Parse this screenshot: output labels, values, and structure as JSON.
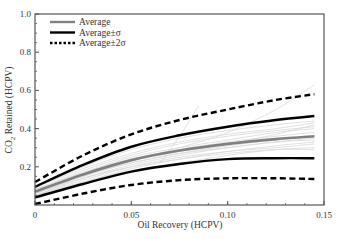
{
  "chart_data": {
    "type": "line",
    "title": "",
    "xlabel": "Oil Recovery (HCPV)",
    "ylabel": "CO2 Retained (HCPV)",
    "ylabel_parts": {
      "prefix": "CO",
      "sub": "2",
      "suffix": " Retained  (HCPV)"
    },
    "xlabel_display": "Oil Recovery  (HCPV)",
    "xlim": [
      0,
      0.15
    ],
    "ylim": [
      0,
      1.0
    ],
    "xticks": [
      0,
      0.05,
      0.1,
      0.15
    ],
    "xtick_labels": [
      "0",
      "0.05",
      "0.10",
      "0.15"
    ],
    "yticks": [
      0.2,
      0.4,
      0.6,
      0.8,
      1.0
    ],
    "ytick_labels": [
      "0.2",
      "0.4",
      "0.6",
      "0.8",
      "1.0"
    ],
    "grid": false,
    "legend_position": "upper left",
    "x": [
      0,
      0.025,
      0.05,
      0.075,
      0.1,
      0.125,
      0.145
    ],
    "series": [
      {
        "name": "Average",
        "style": "solid",
        "color": "#808080",
        "width": 2.6,
        "values": [
          0.07,
          0.16,
          0.235,
          0.285,
          0.32,
          0.345,
          0.36
        ]
      },
      {
        "name": "Average+σ",
        "legend": "Average±σ",
        "style": "solid",
        "color": "#000000",
        "width": 2.4,
        "values": [
          0.095,
          0.21,
          0.305,
          0.365,
          0.41,
          0.445,
          0.466
        ]
      },
      {
        "name": "Average-σ",
        "style": "solid",
        "color": "#000000",
        "width": 2.4,
        "values": [
          0.04,
          0.11,
          0.175,
          0.215,
          0.24,
          0.245,
          0.245
        ]
      },
      {
        "name": "Average+2σ",
        "legend": "Average±2σ",
        "style": "dashed",
        "color": "#000000",
        "width": 2.4,
        "values": [
          0.12,
          0.26,
          0.37,
          0.445,
          0.5,
          0.55,
          0.58
        ]
      },
      {
        "name": "Average-2σ",
        "style": "dashed",
        "color": "#000000",
        "width": 2.4,
        "values": [
          0.005,
          0.06,
          0.105,
          0.13,
          0.14,
          0.14,
          0.136
        ]
      }
    ],
    "background_traces": {
      "color": "#d8d8d8",
      "x": [
        0,
        0.025,
        0.05,
        0.075,
        0.1,
        0.125,
        0.145
      ],
      "traces": [
        [
          0.05,
          0.14,
          0.21,
          0.26,
          0.3,
          0.33,
          0.35
        ],
        [
          0.08,
          0.18,
          0.26,
          0.32,
          0.36,
          0.39,
          0.41
        ],
        [
          0.06,
          0.15,
          0.22,
          0.27,
          0.31,
          0.34,
          0.36
        ],
        [
          0.09,
          0.19,
          0.27,
          0.33,
          0.37,
          0.4,
          0.43
        ],
        [
          0.04,
          0.12,
          0.19,
          0.24,
          0.28,
          0.3,
          0.32
        ],
        [
          0.07,
          0.17,
          0.25,
          0.3,
          0.34,
          0.38,
          0.4
        ],
        [
          0.05,
          0.13,
          0.2,
          0.25,
          0.28,
          0.31,
          0.33
        ],
        [
          0.07,
          0.16,
          0.23,
          0.28,
          0.32,
          0.37,
          0.42
        ],
        [
          0.06,
          0.15,
          0.23,
          0.3,
          0.38,
          0.5,
          0.63
        ],
        [
          0.05,
          0.12,
          0.18,
          0.22,
          0.26,
          0.29,
          0.3
        ],
        [
          0.08,
          0.17,
          0.24,
          0.29,
          0.33,
          0.36,
          0.38
        ],
        [
          0.06,
          0.14,
          0.2,
          0.24,
          0.27,
          0.29,
          0.29
        ],
        [
          0.09,
          0.2,
          0.29,
          0.35,
          0.39,
          0.42,
          0.44
        ],
        [
          0.07,
          0.16,
          0.22,
          0.27,
          0.3,
          0.33,
          0.34
        ]
      ],
      "steep_trace": {
        "x": [
          0.065,
          0.075,
          0.085
        ],
        "values": [
          0.22,
          0.36,
          0.52
        ]
      }
    }
  },
  "legend": {
    "items": [
      {
        "label": "Average",
        "style": "solid",
        "color": "#808080"
      },
      {
        "label": "Average±σ",
        "style": "solid",
        "color": "#000000"
      },
      {
        "label": "Average±2σ",
        "style": "dotted",
        "color": "#000000"
      }
    ]
  }
}
